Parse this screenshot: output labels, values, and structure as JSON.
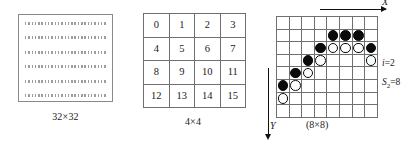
{
  "figure": {
    "panels": [
      {
        "id": "dotted-grid",
        "caption": "32×32",
        "grid_size": "32x32",
        "dot_rows": 6,
        "style": "dotted-rows"
      },
      {
        "id": "numbered-grid",
        "caption": "4×4",
        "rows": 4,
        "cols": 4,
        "cells": [
          [
            "0",
            "1",
            "2",
            "3"
          ],
          [
            "4",
            "5",
            "6",
            "7"
          ],
          [
            "8",
            "9",
            "10",
            "11"
          ],
          [
            "12",
            "13",
            "14",
            "15"
          ]
        ]
      },
      {
        "id": "stone-board",
        "caption": "(8×8)",
        "rows": 8,
        "cols": 8,
        "axis_x_label": "X",
        "axis_y_label": "Y",
        "annotations": {
          "index_label": "i",
          "index_eq": "=2",
          "sum_label": "S",
          "sum_sub": "2",
          "sum_eq": "=8"
        },
        "stones": [
          [
            "",
            "",
            "",
            "",
            "",
            "",
            "",
            ""
          ],
          [
            "",
            "",
            "",
            "",
            "black",
            "black",
            "black",
            ""
          ],
          [
            "",
            "",
            "",
            "black",
            "white",
            "white",
            "white",
            "black"
          ],
          [
            "",
            "",
            "black",
            "white",
            "",
            "",
            "",
            "white"
          ],
          [
            "",
            "black",
            "white",
            "",
            "",
            "",
            "",
            ""
          ],
          [
            "black",
            "white",
            "",
            "",
            "",
            "",
            "",
            ""
          ],
          [
            "white",
            "",
            "",
            "",
            "",
            "",
            "",
            ""
          ],
          [
            "",
            "",
            "",
            "",
            "",
            "",
            "",
            ""
          ]
        ]
      }
    ]
  },
  "colors": {
    "stone_black": "#0b0b0b",
    "stone_white": "#ffffff",
    "grid_line": "#6f6f6f",
    "box_border": "#8a8a8a",
    "background": "#ffffff"
  }
}
